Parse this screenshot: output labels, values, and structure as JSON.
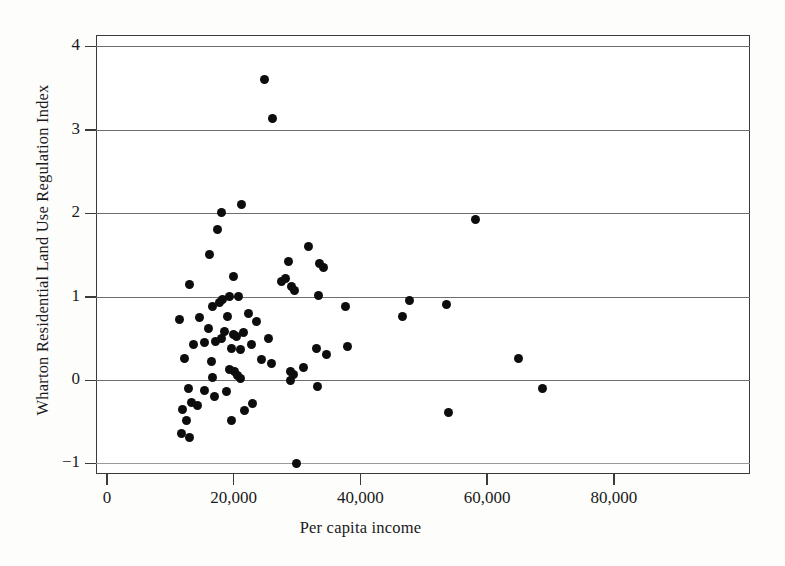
{
  "chart_data": {
    "type": "scatter",
    "title": "",
    "xlabel": "Per capita income",
    "ylabel": "Wharton Residential Land Use Regulation Index",
    "xlim": [
      0,
      103000
    ],
    "ylim": [
      -1.18,
      4.13
    ],
    "xticks": [
      0,
      20000,
      40000,
      60000,
      80000
    ],
    "xtick_labels": [
      "0",
      "20,000",
      "40,000",
      "60,000",
      "80,000"
    ],
    "yticks": [
      -1,
      0,
      1,
      2,
      3,
      4
    ],
    "ytick_labels": [
      "−1",
      "0",
      "1",
      "2",
      "3",
      "4"
    ],
    "grid": "horizontal",
    "legend": null,
    "marker": "filled-circle",
    "marker_color": "#0d0d0d",
    "points": [
      {
        "x": 24900,
        "y": 3.6
      },
      {
        "x": 26200,
        "y": 3.14
      },
      {
        "x": 58200,
        "y": 1.92
      },
      {
        "x": 21300,
        "y": 2.1
      },
      {
        "x": 18000,
        "y": 2.01
      },
      {
        "x": 17500,
        "y": 1.81
      },
      {
        "x": 16200,
        "y": 1.5
      },
      {
        "x": 31800,
        "y": 1.6
      },
      {
        "x": 28700,
        "y": 1.42
      },
      {
        "x": 33600,
        "y": 1.4
      },
      {
        "x": 34200,
        "y": 1.35
      },
      {
        "x": 28200,
        "y": 1.22
      },
      {
        "x": 19900,
        "y": 1.24
      },
      {
        "x": 13000,
        "y": 1.14
      },
      {
        "x": 27500,
        "y": 1.18
      },
      {
        "x": 29200,
        "y": 1.12
      },
      {
        "x": 29600,
        "y": 1.07
      },
      {
        "x": 19300,
        "y": 1.0
      },
      {
        "x": 20700,
        "y": 1.0
      },
      {
        "x": 18300,
        "y": 0.97
      },
      {
        "x": 17800,
        "y": 0.93
      },
      {
        "x": 33400,
        "y": 1.01
      },
      {
        "x": 16600,
        "y": 0.88
      },
      {
        "x": 37600,
        "y": 0.88
      },
      {
        "x": 47700,
        "y": 0.95
      },
      {
        "x": 53600,
        "y": 0.9
      },
      {
        "x": 46700,
        "y": 0.76
      },
      {
        "x": 22300,
        "y": 0.8
      },
      {
        "x": 19000,
        "y": 0.76
      },
      {
        "x": 14600,
        "y": 0.75
      },
      {
        "x": 11400,
        "y": 0.72
      },
      {
        "x": 23600,
        "y": 0.7
      },
      {
        "x": 16000,
        "y": 0.62
      },
      {
        "x": 18600,
        "y": 0.58
      },
      {
        "x": 20000,
        "y": 0.55
      },
      {
        "x": 20500,
        "y": 0.52
      },
      {
        "x": 21500,
        "y": 0.57
      },
      {
        "x": 18100,
        "y": 0.5
      },
      {
        "x": 17100,
        "y": 0.46
      },
      {
        "x": 15400,
        "y": 0.45
      },
      {
        "x": 25500,
        "y": 0.5
      },
      {
        "x": 13600,
        "y": 0.42
      },
      {
        "x": 22800,
        "y": 0.43
      },
      {
        "x": 19600,
        "y": 0.38
      },
      {
        "x": 21000,
        "y": 0.36
      },
      {
        "x": 33000,
        "y": 0.38
      },
      {
        "x": 37900,
        "y": 0.4
      },
      {
        "x": 34600,
        "y": 0.3
      },
      {
        "x": 12300,
        "y": 0.26
      },
      {
        "x": 16500,
        "y": 0.22
      },
      {
        "x": 24400,
        "y": 0.24
      },
      {
        "x": 26000,
        "y": 0.2
      },
      {
        "x": 31000,
        "y": 0.15
      },
      {
        "x": 65000,
        "y": 0.26
      },
      {
        "x": 19400,
        "y": 0.13
      },
      {
        "x": 20100,
        "y": 0.1
      },
      {
        "x": 20600,
        "y": 0.05
      },
      {
        "x": 21000,
        "y": 0.02
      },
      {
        "x": 28900,
        "y": 0.1
      },
      {
        "x": 29400,
        "y": 0.07
      },
      {
        "x": 29000,
        "y": 0.0
      },
      {
        "x": 16700,
        "y": 0.03
      },
      {
        "x": 12800,
        "y": -0.1
      },
      {
        "x": 15400,
        "y": -0.13
      },
      {
        "x": 18800,
        "y": -0.14
      },
      {
        "x": 16900,
        "y": -0.2
      },
      {
        "x": 33200,
        "y": -0.08
      },
      {
        "x": 68700,
        "y": -0.1
      },
      {
        "x": 13400,
        "y": -0.27
      },
      {
        "x": 14300,
        "y": -0.3
      },
      {
        "x": 11900,
        "y": -0.35
      },
      {
        "x": 23000,
        "y": -0.28
      },
      {
        "x": 21700,
        "y": -0.36
      },
      {
        "x": 53900,
        "y": -0.39
      },
      {
        "x": 12600,
        "y": -0.48
      },
      {
        "x": 19700,
        "y": -0.49
      },
      {
        "x": 11700,
        "y": -0.64
      },
      {
        "x": 13100,
        "y": -0.69
      },
      {
        "x": 29900,
        "y": -1.0
      }
    ]
  },
  "axes": {
    "x_origin_px": 107,
    "x_px_per_unit": 0.006335,
    "y_zero_px": 380,
    "y_px_per_unit": 83.4
  }
}
